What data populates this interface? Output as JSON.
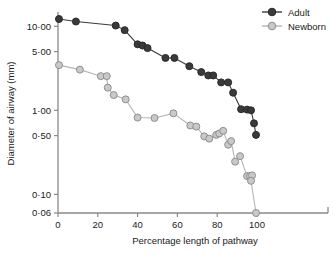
{
  "chart_data": {
    "type": "line",
    "title": "",
    "xlabel": "Percentage length of pathway",
    "ylabel": "Diameter of airway (mm)",
    "xlim": [
      0,
      100
    ],
    "ylim": [
      0.06,
      14
    ],
    "yscale": "log",
    "grid": false,
    "legend_position": "top-right",
    "xticks": [
      0,
      20,
      40,
      60,
      80,
      100
    ],
    "xtick_labels": [
      "0",
      "20",
      "40",
      "60",
      "80",
      "100"
    ],
    "yticks": [
      10.0,
      5.0,
      1.0,
      0.5,
      0.1,
      0.06
    ],
    "ytick_labels": [
      "10·00",
      "5·00",
      "1·00",
      "0·50",
      "0·10",
      "0·06"
    ],
    "series": [
      {
        "name": "Adult",
        "color": "#3a3a3a",
        "marker": "filled-circle",
        "points": [
          [
            0.5,
            12.2
          ],
          [
            9.0,
            11.4
          ],
          [
            29.0,
            10.2
          ],
          [
            33.5,
            9.0
          ],
          [
            40.0,
            6.1
          ],
          [
            42.5,
            5.9
          ],
          [
            45.0,
            5.5
          ],
          [
            54.0,
            4.2
          ],
          [
            58.5,
            4.2
          ],
          [
            66.0,
            3.35
          ],
          [
            72.0,
            2.85
          ],
          [
            75.5,
            2.6
          ],
          [
            78.0,
            2.6
          ],
          [
            82.0,
            2.15
          ],
          [
            85.5,
            2.15
          ],
          [
            88.0,
            1.62
          ],
          [
            92.0,
            1.03
          ],
          [
            95.0,
            1.02
          ],
          [
            97.0,
            1.0
          ],
          [
            98.5,
            0.7
          ],
          [
            99.5,
            0.51
          ]
        ]
      },
      {
        "name": "Newborn",
        "color": "#b5b5b5",
        "marker": "open-circle",
        "points": [
          [
            0.5,
            3.45
          ],
          [
            11.0,
            3.05
          ],
          [
            21.5,
            2.55
          ],
          [
            24.5,
            2.55
          ],
          [
            25.0,
            1.86
          ],
          [
            28.0,
            1.52
          ],
          [
            34.0,
            1.35
          ],
          [
            40.0,
            0.82
          ],
          [
            48.5,
            0.81
          ],
          [
            58.0,
            0.92
          ],
          [
            66.5,
            0.66
          ],
          [
            69.5,
            0.64
          ],
          [
            73.5,
            0.49
          ],
          [
            76.0,
            0.46
          ],
          [
            79.5,
            0.51
          ],
          [
            81.0,
            0.53
          ],
          [
            83.0,
            0.57
          ],
          [
            85.5,
            0.39
          ],
          [
            87.0,
            0.43
          ],
          [
            89.0,
            0.245
          ],
          [
            91.5,
            0.285
          ],
          [
            95.0,
            0.165
          ],
          [
            96.5,
            0.165
          ],
          [
            97.5,
            0.168
          ],
          [
            97.0,
            0.145
          ],
          [
            99.5,
            0.06
          ]
        ]
      }
    ]
  },
  "legend": {
    "items": [
      {
        "label": "Adult",
        "color": "#3a3a3a",
        "marker": "filled-circle"
      },
      {
        "label": "Newborn",
        "color": "#b5b5b5",
        "marker": "open-circle"
      }
    ]
  }
}
